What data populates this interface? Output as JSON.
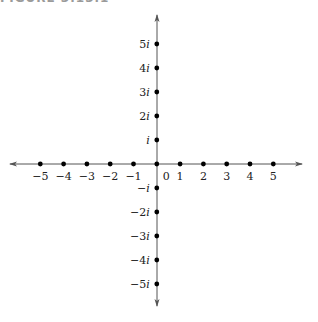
{
  "caption": "FIGURE 3.13.1",
  "chart_data": {
    "type": "scatter",
    "title": "",
    "xlabel": "",
    "ylabel": "",
    "real_axis": {
      "ticks": [
        -5,
        -4,
        -3,
        -2,
        -1,
        0,
        1,
        2,
        3,
        4,
        5
      ],
      "tick_labels": [
        "−5",
        "−4",
        "−3",
        "−2",
        "−1",
        "0",
        "1",
        "2",
        "3",
        "4",
        "5"
      ],
      "range": [
        -6.2,
        6.2
      ]
    },
    "imaginary_axis": {
      "ticks": [
        5,
        4,
        3,
        2,
        1,
        -1,
        -2,
        -3,
        -4,
        -5
      ],
      "tick_labels": [
        "5i",
        "4i",
        "3i",
        "2i",
        "i",
        "−i",
        "−2i",
        "−3i",
        "−4i",
        "−5i"
      ],
      "range": [
        -5.9,
        6.2
      ]
    },
    "points": [
      {
        "x": -5,
        "y": 0
      },
      {
        "x": -4,
        "y": 0
      },
      {
        "x": -3,
        "y": 0
      },
      {
        "x": -2,
        "y": 0
      },
      {
        "x": -1,
        "y": 0
      },
      {
        "x": 0,
        "y": 0
      },
      {
        "x": 1,
        "y": 0
      },
      {
        "x": 2,
        "y": 0
      },
      {
        "x": 3,
        "y": 0
      },
      {
        "x": 4,
        "y": 0
      },
      {
        "x": 5,
        "y": 0
      },
      {
        "x": 0,
        "y": 1
      },
      {
        "x": 0,
        "y": 2
      },
      {
        "x": 0,
        "y": 3
      },
      {
        "x": 0,
        "y": 4
      },
      {
        "x": 0,
        "y": 5
      },
      {
        "x": 0,
        "y": -1
      },
      {
        "x": 0,
        "y": -2
      },
      {
        "x": 0,
        "y": -3
      },
      {
        "x": 0,
        "y": -4
      },
      {
        "x": 0,
        "y": -5
      }
    ],
    "grid": false,
    "legend": null
  }
}
